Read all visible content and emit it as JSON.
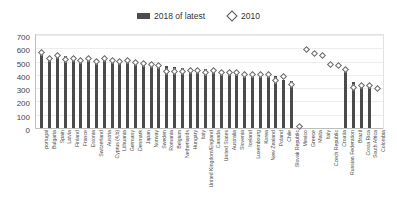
{
  "legend": {
    "series": [
      {
        "label": "2018 of latest",
        "marker": "bar-swatch",
        "color": "#4b4b4b"
      },
      {
        "label": "2010",
        "marker": "diamond-outline",
        "color": "#ffffff"
      }
    ]
  },
  "axis": {
    "y_ticks": [
      "700",
      "600",
      "500",
      "400",
      "300",
      "200",
      "100",
      "0"
    ]
  },
  "chart_data": {
    "type": "bar",
    "title": "",
    "xlabel": "",
    "ylabel": "",
    "ylim": [
      0,
      700
    ],
    "ytick_step": 100,
    "grid": true,
    "legend_position": "top-center",
    "categories": [
      "portugal",
      "Bulgaria",
      "Spain",
      "Latvia",
      "Finland",
      "France",
      "Estonia",
      "Switzerland",
      "Austria",
      "Cyprus (4,b)",
      "Lithuania",
      "Germany",
      "Denmark",
      "Japan",
      "Norway",
      "Sweden",
      "Romania",
      "Belgium",
      "Netherlands",
      "Hungary",
      "Italy",
      "United Kingdom/England",
      "Canada",
      "United States",
      "Australia",
      "Slovenia",
      "Iceland",
      "Luxembourg",
      "Korea",
      "New Zealand",
      "Poland",
      "Chile",
      "Slovak Republic",
      "Mexico",
      "Greece",
      "Malta",
      "Italy",
      "Czech Republic",
      "Croatia",
      "Russian Federation",
      "Brazil",
      "Costa Rica",
      "South Africa",
      "Colombia"
    ],
    "series": [
      {
        "name": "2018 of latest",
        "type": "bar",
        "color": "#4b4b4b",
        "values": [
          560,
          535,
          540,
          545,
          530,
          525,
          530,
          520,
          525,
          520,
          510,
          505,
          500,
          490,
          480,
          470,
          465,
          460,
          455,
          455,
          450,
          445,
          440,
          435,
          430,
          425,
          420,
          415,
          405,
          400,
          395,
          360,
          355,
          null,
          null,
          null,
          null,
          null,
          null,
          430,
          350,
          320,
          310,
          null
        ]
      },
      {
        "name": "2010",
        "type": "scatter",
        "marker": "diamond-outline",
        "color": "#ffffff",
        "values": [
          570,
          520,
          545,
          515,
          520,
          510,
          525,
          500,
          520,
          505,
          500,
          510,
          490,
          485,
          475,
          470,
          425,
          425,
          425,
          430,
          430,
          420,
          430,
          420,
          415,
          420,
          405,
          400,
          405,
          400,
          360,
          385,
          330,
          10,
          590,
          560,
          545,
          480,
          470,
          440,
          305,
          320,
          320,
          300
        ]
      }
    ]
  }
}
